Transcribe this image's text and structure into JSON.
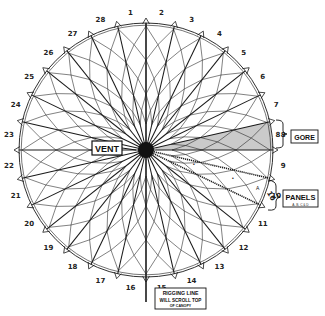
{
  "figure": {
    "colors": {
      "ink": "#1a1a1a",
      "paper": "#ffffff",
      "gore_shade": "#bdbdbd"
    }
  },
  "canopy": {
    "center": [
      146,
      150
    ],
    "outer_radius": 127,
    "gore_count": 28,
    "label_radius": 138,
    "highlighted_gore": 8,
    "panel_gore": 10,
    "gore_numbers": [
      "1",
      "2",
      "3",
      "4",
      "5",
      "6",
      "7",
      "8",
      "9",
      "10",
      "11",
      "12",
      "13",
      "14",
      "15",
      "16",
      "17",
      "18",
      "19",
      "20",
      "21",
      "22",
      "23",
      "24",
      "25",
      "26",
      "27",
      "28"
    ]
  },
  "callouts": {
    "vent": {
      "label": "VENT"
    },
    "gore": {
      "label": "GORE",
      "bracket_number": "8"
    },
    "panels": {
      "label": "PANELS",
      "sublabel": "A, B, C & D",
      "bracket_number": "10",
      "panel_marks": [
        "•",
        "•",
        "A"
      ]
    },
    "rigging_line": {
      "line1": "RIGGING LINE",
      "line2": "WILL SCROLL TOP",
      "line3": "OF CANOPY"
    }
  }
}
